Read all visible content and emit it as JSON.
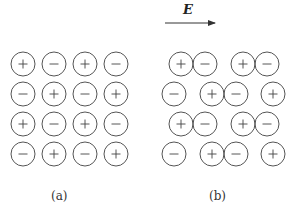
{
  "field": {
    "label": "E",
    "arrow": {
      "x1": 165,
      "y1": 23,
      "x2": 215,
      "y2": 23
    }
  },
  "ion_radius": 12,
  "colors": {
    "stroke": "#555555",
    "text": "#333333",
    "background": "#ffffff"
  },
  "panels": [
    {
      "caption": "(a)",
      "caption_pos": {
        "x": 60,
        "y": 198
      },
      "ions": [
        {
          "x": 23,
          "y": 64,
          "sign": "+"
        },
        {
          "x": 54,
          "y": 64,
          "sign": "−"
        },
        {
          "x": 85,
          "y": 64,
          "sign": "+"
        },
        {
          "x": 116,
          "y": 64,
          "sign": "−"
        },
        {
          "x": 23,
          "y": 94,
          "sign": "−"
        },
        {
          "x": 54,
          "y": 94,
          "sign": "+"
        },
        {
          "x": 85,
          "y": 94,
          "sign": "−"
        },
        {
          "x": 116,
          "y": 94,
          "sign": "+"
        },
        {
          "x": 23,
          "y": 124,
          "sign": "+"
        },
        {
          "x": 54,
          "y": 124,
          "sign": "−"
        },
        {
          "x": 85,
          "y": 124,
          "sign": "+"
        },
        {
          "x": 116,
          "y": 124,
          "sign": "−"
        },
        {
          "x": 23,
          "y": 154,
          "sign": "−"
        },
        {
          "x": 54,
          "y": 154,
          "sign": "+"
        },
        {
          "x": 85,
          "y": 154,
          "sign": "−"
        },
        {
          "x": 116,
          "y": 154,
          "sign": "+"
        }
      ]
    },
    {
      "caption": "(b)",
      "caption_pos": {
        "x": 218,
        "y": 198
      },
      "ions": [
        {
          "x": 181,
          "y": 64,
          "sign": "+"
        },
        {
          "x": 205,
          "y": 64,
          "sign": "−"
        },
        {
          "x": 243,
          "y": 64,
          "sign": "+"
        },
        {
          "x": 267,
          "y": 64,
          "sign": "−"
        },
        {
          "x": 174,
          "y": 94,
          "sign": "−"
        },
        {
          "x": 212,
          "y": 94,
          "sign": "+"
        },
        {
          "x": 236,
          "y": 94,
          "sign": "−"
        },
        {
          "x": 273,
          "y": 94,
          "sign": "+"
        },
        {
          "x": 181,
          "y": 124,
          "sign": "+"
        },
        {
          "x": 205,
          "y": 124,
          "sign": "−"
        },
        {
          "x": 243,
          "y": 124,
          "sign": "+"
        },
        {
          "x": 267,
          "y": 124,
          "sign": "−"
        },
        {
          "x": 174,
          "y": 154,
          "sign": "−"
        },
        {
          "x": 212,
          "y": 154,
          "sign": "+"
        },
        {
          "x": 236,
          "y": 154,
          "sign": "−"
        },
        {
          "x": 273,
          "y": 154,
          "sign": "+"
        }
      ]
    }
  ]
}
